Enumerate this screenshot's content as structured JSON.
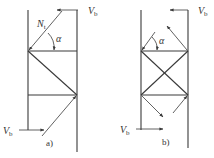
{
  "figure_a": {
    "caption": "a)",
    "top_force": {
      "symbol": "V",
      "subscript": "b"
    },
    "bottom_force": {
      "symbol": "V",
      "subscript": "b"
    },
    "diagonal_force": {
      "symbol": "N",
      "subscript": "t"
    },
    "angle": "α"
  },
  "figure_b": {
    "caption": "b)",
    "top_force": {
      "symbol": "V",
      "subscript": "b"
    },
    "bottom_force": {
      "symbol": "V",
      "subscript": "b"
    },
    "angle": "α"
  },
  "colors": {
    "line": "#3a3a3a",
    "background": "#ffffff"
  }
}
